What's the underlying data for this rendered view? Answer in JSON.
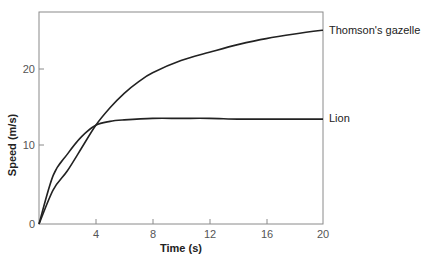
{
  "chart_data": {
    "type": "line",
    "title": "",
    "xlabel": "Time (s)",
    "ylabel": "Speed (m/s)",
    "xlim": [
      0,
      20
    ],
    "ylim": [
      0,
      27.5
    ],
    "xticks": [
      4,
      8,
      12,
      16,
      20
    ],
    "yticks": [
      0,
      10,
      20
    ],
    "grid": false,
    "legend_position": "inline-right",
    "series": [
      {
        "name": "Thomson's gazelle",
        "x": [
          0,
          1,
          2,
          3,
          4,
          5,
          6,
          7,
          8,
          10,
          12,
          14,
          16,
          18,
          20
        ],
        "values": [
          0,
          4.5,
          7.0,
          10.0,
          13.0,
          15.3,
          17.2,
          18.7,
          19.9,
          21.5,
          22.6,
          23.6,
          24.4,
          25.0,
          25.5
        ]
      },
      {
        "name": "Lion",
        "x": [
          0,
          1,
          2,
          3,
          4,
          5,
          6,
          8,
          10,
          12,
          14,
          16,
          18,
          20
        ],
        "values": [
          0,
          6.4,
          9.2,
          11.5,
          13.0,
          13.5,
          13.7,
          13.9,
          13.9,
          13.9,
          13.8,
          13.8,
          13.8,
          13.8
        ]
      }
    ]
  },
  "labels": {
    "xlabel": "Time (s)",
    "ylabel": "Speed (m/s)",
    "x_ticks": [
      "4",
      "8",
      "12",
      "16",
      "20"
    ],
    "y_ticks": [
      "0",
      "10",
      "20"
    ],
    "series_gazelle": "Thomson's gazelle",
    "series_lion": "Lion"
  },
  "colors": {
    "line": "#222222",
    "frame": "#888888"
  }
}
